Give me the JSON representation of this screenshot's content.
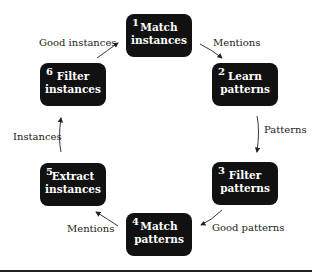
{
  "diagram": {
    "nodes": [
      {
        "num": "1",
        "label": "Match\ninstances"
      },
      {
        "num": "2",
        "label": "Learn\npatterns"
      },
      {
        "num": "3",
        "label": "Filter\npatterns"
      },
      {
        "num": "4",
        "label": "Match\npatterns"
      },
      {
        "num": "5",
        "label": "Extract\ninstances"
      },
      {
        "num": "6",
        "label": "Filter\ninstances"
      }
    ],
    "edges": [
      {
        "from": "1",
        "to": "2",
        "label": "Mentions"
      },
      {
        "from": "2",
        "to": "3",
        "label": "Patterns"
      },
      {
        "from": "3",
        "to": "4",
        "label": "Good patterns"
      },
      {
        "from": "4",
        "to": "5",
        "label": "Mentions"
      },
      {
        "from": "5",
        "to": "6",
        "label": "Instances"
      },
      {
        "from": "6",
        "to": "1",
        "label": "Good instances"
      }
    ],
    "colors": {
      "box": "#111111",
      "text": "#ffffff",
      "edge": "#222222"
    }
  }
}
